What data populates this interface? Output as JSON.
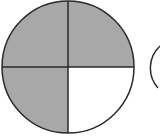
{
  "diagram": {
    "type": "fraction-circle",
    "parts": 4,
    "shaded_parts": 3,
    "fraction": "3/4",
    "shaded_quadrants": [
      "top-left",
      "top-right",
      "bottom-left"
    ],
    "unshaded_quadrants": [
      "bottom-right"
    ],
    "colors": {
      "shade": "#a8a8a8",
      "stroke": "#2a2a2a",
      "background": "#ffffff"
    },
    "partial_second_circle_visible": true
  }
}
